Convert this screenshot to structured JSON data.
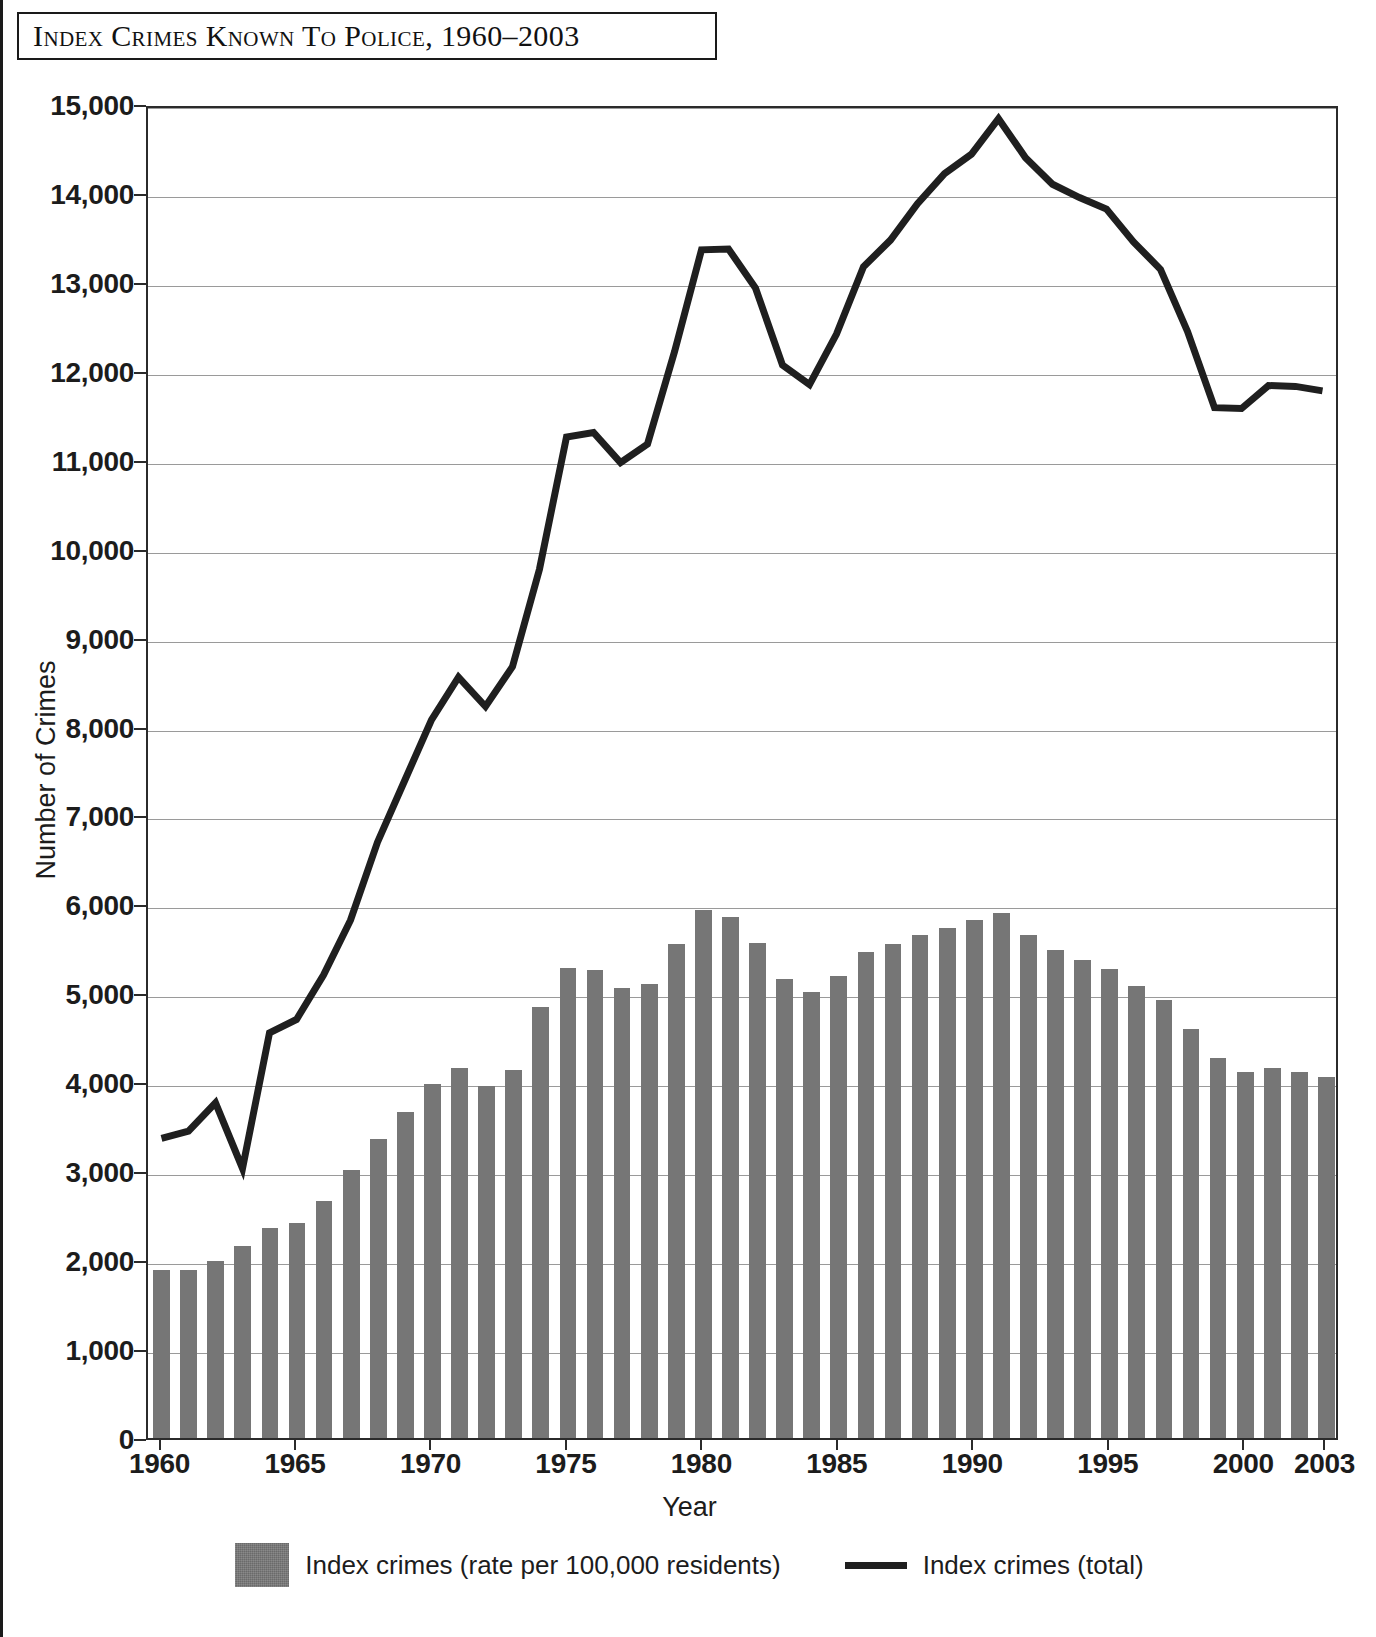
{
  "figure": {
    "title": "Index Crimes Known to Police, 1960–2003"
  },
  "axes": {
    "y_title": "Number of Crimes",
    "x_title": "Year",
    "y_ticks": [
      "0",
      "1,000",
      "2,000",
      "3,000",
      "4,000",
      "5,000",
      "6,000",
      "7,000",
      "8,000",
      "9,000",
      "10,000",
      "11,000",
      "12,000",
      "13,000",
      "14,000",
      "15,000"
    ],
    "x_ticks": [
      "1960",
      "1965",
      "1970",
      "1975",
      "1980",
      "1985",
      "1990",
      "1995",
      "2000",
      "2003"
    ]
  },
  "legend": {
    "items": [
      {
        "label": "Index crimes (rate per 100,000 residents)",
        "marker": "bar-swatch",
        "color": "#767676"
      },
      {
        "label": "Index crimes (total)",
        "marker": "line-swatch",
        "color": "#1f1f1f"
      }
    ]
  },
  "chart_data": {
    "type": "bar",
    "title": "Index Crimes Known to Police, 1960–2003",
    "xlabel": "Year",
    "ylabel": "Number of Crimes",
    "ylim": [
      0,
      15000
    ],
    "xlim": [
      1960,
      2003
    ],
    "grid": true,
    "legend_position": "bottom",
    "categories": [
      1960,
      1961,
      1962,
      1963,
      1964,
      1965,
      1966,
      1967,
      1968,
      1969,
      1970,
      1971,
      1972,
      1973,
      1974,
      1975,
      1976,
      1977,
      1978,
      1979,
      1980,
      1981,
      1982,
      1983,
      1984,
      1985,
      1986,
      1987,
      1988,
      1989,
      1990,
      1991,
      1992,
      1993,
      1994,
      1995,
      1996,
      1997,
      1998,
      1999,
      2000,
      2001,
      2002,
      2003
    ],
    "series": [
      {
        "name": "Index crimes (rate per 100,000 residents)",
        "type": "bar",
        "color": "#767676",
        "values": [
          1885,
          1885,
          1990,
          2160,
          2360,
          2420,
          2670,
          3010,
          3360,
          3670,
          3980,
          4160,
          3960,
          4140,
          4850,
          5280,
          5260,
          5060,
          5110,
          5550,
          5940,
          5860,
          5570,
          5160,
          5020,
          5190,
          5460,
          5550,
          5660,
          5740,
          5820,
          5900,
          5660,
          5490,
          5370,
          5270,
          5080,
          4930,
          4600,
          4270,
          4120,
          4160,
          4110,
          4060
        ]
      },
      {
        "name": "Index crimes (total)",
        "type": "line",
        "color": "#1f1f1f",
        "values": [
          3380,
          3460,
          3780,
          3040,
          4570,
          4720,
          5220,
          5840,
          6720,
          7410,
          8100,
          8580,
          8250,
          8700,
          9800,
          11290,
          11340,
          11000,
          11210,
          12250,
          13400,
          13410,
          12970,
          12100,
          11880,
          12450,
          13210,
          13510,
          13920,
          14260,
          14480,
          14880,
          14440,
          14140,
          13990,
          13860,
          13490,
          13180,
          12480,
          11620,
          11610,
          11870,
          11860,
          11810
        ]
      }
    ]
  }
}
